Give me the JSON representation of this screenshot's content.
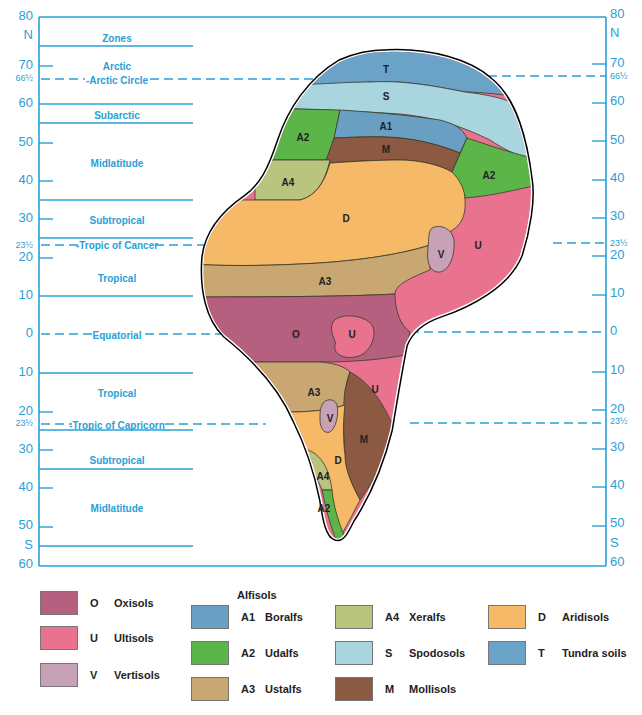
{
  "axis": {
    "left_labels": [
      {
        "text": "80",
        "y": 17,
        "size": 13
      },
      {
        "text": "N",
        "y": 36,
        "size": 13
      },
      {
        "text": "70",
        "y": 66,
        "size": 13
      },
      {
        "text": "66½",
        "y": 79,
        "size": 9
      },
      {
        "text": "60",
        "y": 104,
        "size": 13
      },
      {
        "text": "50",
        "y": 143,
        "size": 13
      },
      {
        "text": "40",
        "y": 181,
        "size": 13
      },
      {
        "text": "30",
        "y": 219,
        "size": 13
      },
      {
        "text": "23½",
        "y": 246,
        "size": 9
      },
      {
        "text": "20",
        "y": 258,
        "size": 13
      },
      {
        "text": "10",
        "y": 296,
        "size": 13
      },
      {
        "text": "0",
        "y": 334,
        "size": 13
      },
      {
        "text": "10",
        "y": 373,
        "size": 13
      },
      {
        "text": "20",
        "y": 412,
        "size": 13
      },
      {
        "text": "23½",
        "y": 424,
        "size": 9
      },
      {
        "text": "30",
        "y": 450,
        "size": 13
      },
      {
        "text": "40",
        "y": 488,
        "size": 13
      },
      {
        "text": "50",
        "y": 526,
        "size": 13
      },
      {
        "text": "S",
        "y": 546,
        "size": 13
      },
      {
        "text": "60",
        "y": 565,
        "size": 13
      }
    ],
    "hemisphere_north": "N",
    "hemisphere_south": "S"
  },
  "zones": [
    {
      "label": "Zones",
      "y": 39
    },
    {
      "label": "Arctic",
      "y": 67
    },
    {
      "label": "-Arctic Circle",
      "y": 81
    },
    {
      "label": "Subarctic",
      "y": 116
    },
    {
      "label": "Midlatitude",
      "y": 164
    },
    {
      "label": "Subtropical",
      "y": 221
    },
    {
      "label": "-Tropic of Cancer",
      "y": 246
    },
    {
      "label": "Tropical",
      "y": 279
    },
    {
      "label": "Equatorial",
      "y": 336
    },
    {
      "label": "Tropical",
      "y": 394
    },
    {
      "label": "-Tropic of Capricorn",
      "y": 426
    },
    {
      "label": "Subtropical",
      "y": 461
    },
    {
      "label": "Midlatitude",
      "y": 509
    }
  ],
  "map_labels": [
    {
      "text": "T",
      "x": 386,
      "y": 70
    },
    {
      "text": "S",
      "x": 386,
      "y": 97
    },
    {
      "text": "A2",
      "x": 303,
      "y": 138
    },
    {
      "text": "A1",
      "x": 386,
      "y": 127
    },
    {
      "text": "M",
      "x": 386,
      "y": 150
    },
    {
      "text": "A2",
      "x": 489,
      "y": 176
    },
    {
      "text": "A4",
      "x": 288,
      "y": 183
    },
    {
      "text": "D",
      "x": 346,
      "y": 219
    },
    {
      "text": "V",
      "x": 441,
      "y": 255
    },
    {
      "text": "U",
      "x": 478,
      "y": 246
    },
    {
      "text": "A3",
      "x": 325,
      "y": 282
    },
    {
      "text": "O",
      "x": 296,
      "y": 335
    },
    {
      "text": "U",
      "x": 352,
      "y": 335
    },
    {
      "text": "A3",
      "x": 314,
      "y": 393
    },
    {
      "text": "U",
      "x": 375,
      "y": 390
    },
    {
      "text": "V",
      "x": 330,
      "y": 419
    },
    {
      "text": "M",
      "x": 364,
      "y": 440
    },
    {
      "text": "D",
      "x": 338,
      "y": 461
    },
    {
      "text": "A4",
      "x": 323,
      "y": 477
    },
    {
      "text": "A2",
      "x": 324,
      "y": 509
    }
  ],
  "colors": {
    "axis_blue": "#2aa0d6",
    "O": "#b5607f",
    "U": "#e9738f",
    "V": "#c7a2b6",
    "A1": "#6a9fc4",
    "A2": "#5bb548",
    "A3": "#c8a772",
    "A4": "#b9c47f",
    "S": "#a8d5de",
    "M": "#8c5a42",
    "D": "#f5b967",
    "T": "#6aa2c8"
  },
  "legend": {
    "alfisols_heading": "Alfisols",
    "items": [
      {
        "code": "O",
        "name": "Oxisols",
        "color": "#b5607f"
      },
      {
        "code": "U",
        "name": "Ultisols",
        "color": "#e9738f"
      },
      {
        "code": "V",
        "name": "Vertisols",
        "color": "#c7a2b6"
      },
      {
        "code": "A1",
        "name": "Boralfs",
        "color": "#6a9fc4"
      },
      {
        "code": "A2",
        "name": "Udalfs",
        "color": "#5bb548"
      },
      {
        "code": "A3",
        "name": "Ustalfs",
        "color": "#c8a772"
      },
      {
        "code": "A4",
        "name": "Xeralfs",
        "color": "#b9c47f"
      },
      {
        "code": "S",
        "name": "Spodosols",
        "color": "#a8d5de"
      },
      {
        "code": "M",
        "name": "Mollisols",
        "color": "#8c5a42"
      },
      {
        "code": "D",
        "name": "Aridisols",
        "color": "#f5b967"
      },
      {
        "code": "T",
        "name": "Tundra soils",
        "color": "#6aa2c8"
      }
    ]
  }
}
